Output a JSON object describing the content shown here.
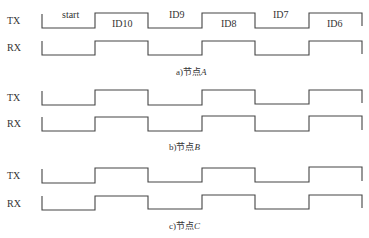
{
  "diagram": {
    "type": "timing-diagram",
    "time_edges_x": [
      42,
      95,
      148,
      202,
      255,
      309,
      362
    ],
    "panels": [
      {
        "id": "A",
        "caption": "a)节点A",
        "caption_prefix": "a)节点",
        "caption_node": "A",
        "signals": [
          {
            "name": "TX",
            "levels": [
              0,
              1,
              0,
              1,
              0,
              1
            ],
            "segment_labels": [
              "start",
              "ID10",
              "ID9",
              "ID8",
              "ID7",
              "ID6"
            ]
          },
          {
            "name": "RX",
            "levels": [
              0,
              1,
              0,
              1,
              0,
              1
            ]
          }
        ]
      },
      {
        "id": "B",
        "caption": "b)节点B",
        "caption_prefix": "b)节点",
        "caption_node": "B",
        "signals": [
          {
            "name": "TX",
            "levels": [
              0,
              1,
              0,
              1,
              0,
              1
            ]
          },
          {
            "name": "RX",
            "levels": [
              0,
              1,
              0,
              1,
              0,
              1
            ]
          }
        ]
      },
      {
        "id": "C",
        "caption": "c)节点C",
        "caption_prefix": "c)节点",
        "caption_node": "C",
        "signals": [
          {
            "name": "TX",
            "levels": [
              0,
              1,
              0,
              1,
              0,
              1
            ]
          },
          {
            "name": "RX",
            "levels": [
              0,
              1,
              0,
              1,
              0,
              1
            ]
          }
        ]
      }
    ]
  },
  "labels": {
    "tx": "TX",
    "rx": "RX",
    "start": "start",
    "id10": "ID10",
    "id9": "ID9",
    "id8": "ID8",
    "id7": "ID7",
    "id6": "ID6"
  },
  "colors": {
    "line": "#444444",
    "text": "#333333",
    "background": "#ffffff"
  }
}
